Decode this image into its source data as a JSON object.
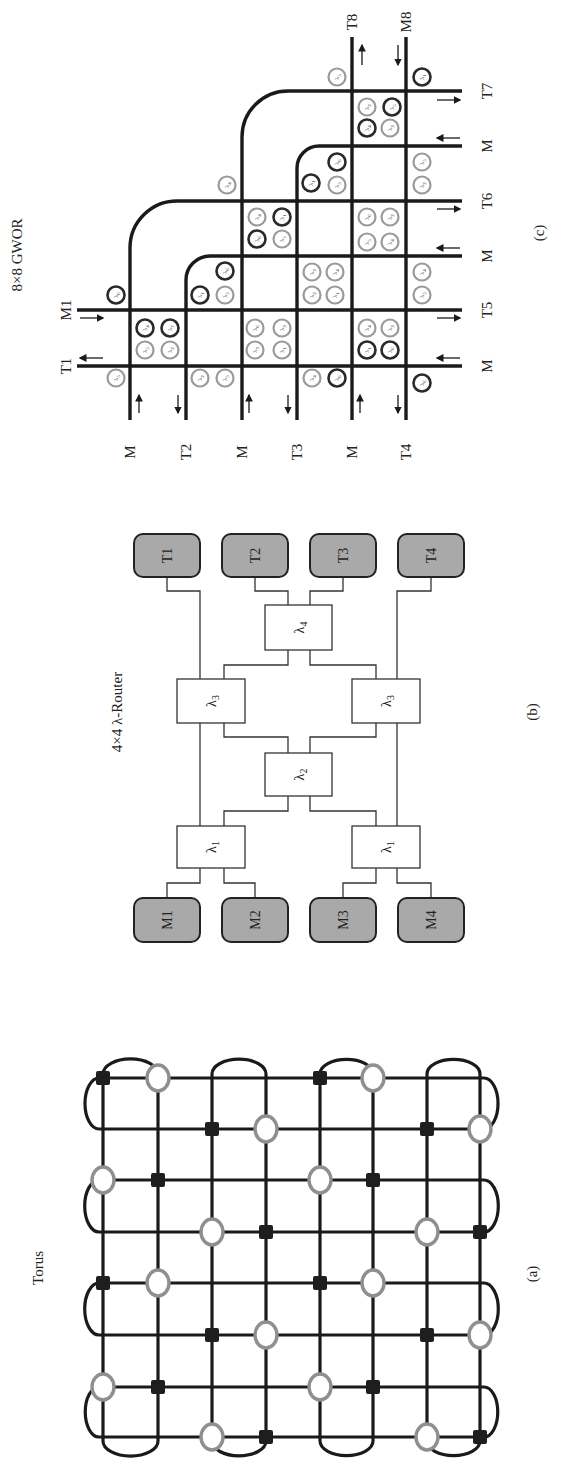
{
  "figure": {
    "panels": [
      {
        "id": "a",
        "title": "Torus",
        "caption": "(a)"
      },
      {
        "id": "b",
        "title": "4×4 λ-Router",
        "caption": "(b)"
      },
      {
        "id": "c",
        "title": "8×8 GWOR",
        "caption": "(c)"
      }
    ]
  },
  "colors": {
    "line": "#1a1a1a",
    "ring_dark": "#2a2a2a",
    "ring_gray": "#9a9a9a",
    "terminal_fill": "#a9a9a9",
    "oval_stroke": "#8f8f8f",
    "square_fill": "#1e1e1e"
  },
  "torus": {
    "title_pos": [
      38,
      1268
    ],
    "caption_pos": [
      532,
      1274
    ],
    "cols": [
      103,
      158,
      212,
      266,
      320,
      373,
      427,
      480
    ],
    "rows": [
      1078,
      1129,
      1180,
      1232,
      1283,
      1335,
      1387,
      1437
    ],
    "nodes": [
      {
        "row": 0,
        "col": 0,
        "type": "square"
      },
      {
        "row": 0,
        "col": 1,
        "type": "oval"
      },
      {
        "row": 0,
        "col": 4,
        "type": "square"
      },
      {
        "row": 0,
        "col": 5,
        "type": "oval"
      },
      {
        "row": 1,
        "col": 2,
        "type": "square"
      },
      {
        "row": 1,
        "col": 3,
        "type": "oval"
      },
      {
        "row": 1,
        "col": 6,
        "type": "square"
      },
      {
        "row": 1,
        "col": 7,
        "type": "oval"
      },
      {
        "row": 2,
        "col": 0,
        "type": "oval"
      },
      {
        "row": 2,
        "col": 1,
        "type": "square"
      },
      {
        "row": 2,
        "col": 4,
        "type": "oval"
      },
      {
        "row": 2,
        "col": 5,
        "type": "square"
      },
      {
        "row": 3,
        "col": 2,
        "type": "oval"
      },
      {
        "row": 3,
        "col": 3,
        "type": "square"
      },
      {
        "row": 3,
        "col": 6,
        "type": "oval"
      },
      {
        "row": 3,
        "col": 7,
        "type": "square"
      },
      {
        "row": 4,
        "col": 0,
        "type": "square"
      },
      {
        "row": 4,
        "col": 1,
        "type": "oval"
      },
      {
        "row": 4,
        "col": 4,
        "type": "square"
      },
      {
        "row": 4,
        "col": 5,
        "type": "oval"
      },
      {
        "row": 5,
        "col": 2,
        "type": "square"
      },
      {
        "row": 5,
        "col": 3,
        "type": "oval"
      },
      {
        "row": 5,
        "col": 6,
        "type": "square"
      },
      {
        "row": 5,
        "col": 7,
        "type": "oval"
      },
      {
        "row": 6,
        "col": 0,
        "type": "oval"
      },
      {
        "row": 6,
        "col": 1,
        "type": "square"
      },
      {
        "row": 6,
        "col": 4,
        "type": "oval"
      },
      {
        "row": 6,
        "col": 5,
        "type": "square"
      },
      {
        "row": 7,
        "col": 2,
        "type": "oval"
      },
      {
        "row": 7,
        "col": 3,
        "type": "square"
      },
      {
        "row": 7,
        "col": 6,
        "type": "oval"
      },
      {
        "row": 7,
        "col": 7,
        "type": "square"
      }
    ]
  },
  "router": {
    "title_pos": [
      117,
      712
    ],
    "caption_pos": [
      532,
      712
    ],
    "terminals": [
      {
        "label": "T1",
        "x": 134,
        "y": 534,
        "w": 66,
        "h": 43
      },
      {
        "label": "T2",
        "x": 222,
        "y": 534,
        "w": 66,
        "h": 43
      },
      {
        "label": "T3",
        "x": 310,
        "y": 534,
        "w": 66,
        "h": 43
      },
      {
        "label": "T4",
        "x": 398,
        "y": 534,
        "w": 66,
        "h": 43
      },
      {
        "label": "M1",
        "x": 134,
        "y": 898,
        "w": 66,
        "h": 44
      },
      {
        "label": "M2",
        "x": 222,
        "y": 898,
        "w": 66,
        "h": 44
      },
      {
        "label": "M3",
        "x": 310,
        "y": 898,
        "w": 66,
        "h": 44
      },
      {
        "label": "M4",
        "x": 398,
        "y": 898,
        "w": 66,
        "h": 44
      }
    ],
    "filters": [
      {
        "label": "λ",
        "sub": "4",
        "x": 265,
        "y": 605,
        "w": 67,
        "h": 45
      },
      {
        "label": "λ",
        "sub": "3",
        "x": 177,
        "y": 679,
        "w": 68,
        "h": 44
      },
      {
        "label": "λ",
        "sub": "3",
        "x": 352,
        "y": 679,
        "w": 68,
        "h": 44
      },
      {
        "label": "λ",
        "sub": "2",
        "x": 265,
        "y": 753,
        "w": 67,
        "h": 43
      },
      {
        "label": "λ",
        "sub": "1",
        "x": 177,
        "y": 826,
        "w": 68,
        "h": 42
      },
      {
        "label": "λ",
        "sub": "1",
        "x": 352,
        "y": 826,
        "w": 68,
        "h": 42
      }
    ],
    "wires": [
      [
        [
          167,
          577
        ],
        [
          167,
          591
        ],
        [
          200,
          591
        ],
        [
          200,
          679
        ]
      ],
      [
        [
          255,
          577
        ],
        [
          255,
          591
        ],
        [
          288,
          591
        ],
        [
          288,
          605
        ]
      ],
      [
        [
          343,
          577
        ],
        [
          343,
          591
        ],
        [
          310,
          591
        ],
        [
          310,
          605
        ]
      ],
      [
        [
          431,
          577
        ],
        [
          431,
          591
        ],
        [
          397,
          591
        ],
        [
          397,
          679
        ]
      ],
      [
        [
          288,
          650
        ],
        [
          288,
          665
        ],
        [
          224,
          665
        ],
        [
          224,
          679
        ]
      ],
      [
        [
          310,
          650
        ],
        [
          310,
          665
        ],
        [
          376,
          665
        ],
        [
          376,
          679
        ]
      ],
      [
        [
          200,
          723
        ],
        [
          200,
          826
        ]
      ],
      [
        [
          397,
          723
        ],
        [
          397,
          826
        ]
      ],
      [
        [
          224,
          723
        ],
        [
          224,
          737
        ],
        [
          288,
          737
        ],
        [
          288,
          753
        ]
      ],
      [
        [
          376,
          723
        ],
        [
          376,
          737
        ],
        [
          310,
          737
        ],
        [
          310,
          753
        ]
      ],
      [
        [
          288,
          796
        ],
        [
          288,
          811
        ],
        [
          224,
          811
        ],
        [
          224,
          826
        ]
      ],
      [
        [
          310,
          796
        ],
        [
          310,
          811
        ],
        [
          376,
          811
        ],
        [
          376,
          826
        ]
      ],
      [
        [
          200,
          868
        ],
        [
          200,
          883
        ],
        [
          167,
          883
        ],
        [
          167,
          898
        ]
      ],
      [
        [
          224,
          868
        ],
        [
          224,
          883
        ],
        [
          255,
          883
        ],
        [
          255,
          898
        ]
      ],
      [
        [
          376,
          868
        ],
        [
          376,
          883
        ],
        [
          343,
          883
        ],
        [
          343,
          898
        ]
      ],
      [
        [
          397,
          868
        ],
        [
          397,
          883
        ],
        [
          431,
          883
        ],
        [
          431,
          898
        ]
      ]
    ]
  },
  "gwor": {
    "title_pos": [
      17,
      255
    ],
    "caption_pos": [
      539,
      233
    ],
    "vlines": [
      {
        "x": 130,
        "y1": 247,
        "y2": 420,
        "label": "M",
        "curve_to_row": 201,
        "r": 47
      },
      {
        "x": 186,
        "y1": 280,
        "y2": 420,
        "label": "T2",
        "curve_to_row": 256,
        "r": 24
      },
      {
        "x": 242,
        "y1": 137,
        "y2": 420,
        "label": "M",
        "curve_to_row": 91,
        "r": 46
      },
      {
        "x": 297,
        "y1": 168,
        "y2": 420,
        "label": "T3",
        "curve_to_row": 146,
        "r": 22
      },
      {
        "x": 352,
        "y1": 37,
        "y2": 420,
        "label": "M",
        "top_label": "T8"
      },
      {
        "x": 406,
        "y1": 37,
        "y2": 420,
        "label": "T4",
        "top_label": "M8"
      }
    ],
    "hlines": [
      {
        "y": 91,
        "x1": 288,
        "x2": 462,
        "label": "T7"
      },
      {
        "y": 146,
        "x1": 319,
        "x2": 462,
        "label": "M"
      },
      {
        "y": 201,
        "x1": 177,
        "x2": 462,
        "label": "T6"
      },
      {
        "y": 256,
        "x1": 210,
        "x2": 462,
        "label": "M"
      },
      {
        "y": 310,
        "x1": 77,
        "x2": 462,
        "label": "T5",
        "left_label": "M1"
      },
      {
        "y": 366,
        "x1": 77,
        "x2": 462,
        "label": "M",
        "left_label": "T1"
      }
    ],
    "bottom_label_y": 452,
    "right_label_x": 487,
    "top_label_y": 22,
    "left_label_x": 66,
    "arrows": [
      {
        "x1": 80,
        "y1": 318,
        "x2": 103,
        "y2": 318
      },
      {
        "x1": 103,
        "y1": 358,
        "x2": 80,
        "y2": 358
      },
      {
        "x1": 139,
        "y1": 413,
        "x2": 139,
        "y2": 395
      },
      {
        "x1": 178,
        "y1": 395,
        "x2": 178,
        "y2": 413
      },
      {
        "x1": 249,
        "y1": 413,
        "x2": 249,
        "y2": 395
      },
      {
        "x1": 288,
        "y1": 395,
        "x2": 288,
        "y2": 413
      },
      {
        "x1": 360,
        "y1": 413,
        "x2": 360,
        "y2": 395
      },
      {
        "x1": 398,
        "y1": 395,
        "x2": 398,
        "y2": 413
      },
      {
        "x1": 437,
        "y1": 100,
        "x2": 460,
        "y2": 100
      },
      {
        "x1": 460,
        "y1": 138,
        "x2": 437,
        "y2": 138
      },
      {
        "x1": 437,
        "y1": 209,
        "x2": 460,
        "y2": 209
      },
      {
        "x1": 460,
        "y1": 248,
        "x2": 437,
        "y2": 248
      },
      {
        "x1": 437,
        "y1": 318,
        "x2": 460,
        "y2": 318
      },
      {
        "x1": 460,
        "y1": 358,
        "x2": 437,
        "y2": 358
      },
      {
        "x1": 362,
        "y1": 65,
        "x2": 362,
        "y2": 45
      },
      {
        "x1": 398,
        "y1": 45,
        "x2": 398,
        "y2": 65
      }
    ],
    "rings": [
      {
        "x": 116,
        "y": 295,
        "tone": "dark",
        "sub": "6"
      },
      {
        "x": 116,
        "y": 378,
        "tone": "gray",
        "sub": "5"
      },
      {
        "x": 145,
        "y": 328,
        "tone": "dark",
        "sub": "4"
      },
      {
        "x": 170,
        "y": 328,
        "tone": "dark",
        "sub": "7"
      },
      {
        "x": 145,
        "y": 350,
        "tone": "gray",
        "sub": "5"
      },
      {
        "x": 170,
        "y": 350,
        "tone": "gray",
        "sub": "2"
      },
      {
        "x": 200,
        "y": 295,
        "tone": "dark",
        "sub": "1"
      },
      {
        "x": 225,
        "y": 295,
        "tone": "gray",
        "sub": "5"
      },
      {
        "x": 225,
        "y": 271,
        "tone": "dark",
        "sub": "6"
      },
      {
        "x": 200,
        "y": 378,
        "tone": "gray",
        "sub": "2"
      },
      {
        "x": 225,
        "y": 378,
        "tone": "gray",
        "sub": "5"
      },
      {
        "x": 255,
        "y": 328,
        "tone": "gray",
        "sub": "6"
      },
      {
        "x": 282,
        "y": 328,
        "tone": "gray",
        "sub": "3"
      },
      {
        "x": 255,
        "y": 350,
        "tone": "gray",
        "sub": "3"
      },
      {
        "x": 282,
        "y": 350,
        "tone": "gray",
        "sub": "1"
      },
      {
        "x": 257,
        "y": 239,
        "tone": "dark",
        "sub": "6"
      },
      {
        "x": 282,
        "y": 239,
        "tone": "gray",
        "sub": "5"
      },
      {
        "x": 257,
        "y": 217,
        "tone": "gray",
        "sub": "4"
      },
      {
        "x": 282,
        "y": 217,
        "tone": "dark",
        "sub": "1"
      },
      {
        "x": 227,
        "y": 185,
        "tone": "gray",
        "sub": "4"
      },
      {
        "x": 312,
        "y": 295,
        "tone": "gray",
        "sub": "2"
      },
      {
        "x": 335,
        "y": 295,
        "tone": "gray",
        "sub": "1"
      },
      {
        "x": 312,
        "y": 272,
        "tone": "gray",
        "sub": "3"
      },
      {
        "x": 335,
        "y": 272,
        "tone": "gray",
        "sub": "4"
      },
      {
        "x": 312,
        "y": 378,
        "tone": "gray",
        "sub": "4"
      },
      {
        "x": 337,
        "y": 378,
        "tone": "dark",
        "sub": "6"
      },
      {
        "x": 311,
        "y": 183,
        "tone": "dark",
        "sub": "1"
      },
      {
        "x": 337,
        "y": 185,
        "tone": "gray",
        "sub": "5"
      },
      {
        "x": 337,
        "y": 162,
        "tone": "dark",
        "sub": "6"
      },
      {
        "x": 367,
        "y": 350,
        "tone": "dark",
        "sub": "1"
      },
      {
        "x": 390,
        "y": 350,
        "tone": "dark",
        "sub": "6"
      },
      {
        "x": 367,
        "y": 328,
        "tone": "gray",
        "sub": "4"
      },
      {
        "x": 390,
        "y": 328,
        "tone": "gray",
        "sub": "3"
      },
      {
        "x": 367,
        "y": 242,
        "tone": "gray",
        "sub": "5"
      },
      {
        "x": 390,
        "y": 242,
        "tone": "gray",
        "sub": "4"
      },
      {
        "x": 367,
        "y": 217,
        "tone": "gray",
        "sub": "6"
      },
      {
        "x": 390,
        "y": 217,
        "tone": "gray",
        "sub": "2"
      },
      {
        "x": 367,
        "y": 128,
        "tone": "dark",
        "sub": "4"
      },
      {
        "x": 390,
        "y": 128,
        "tone": "gray",
        "sub": "3"
      },
      {
        "x": 367,
        "y": 107,
        "tone": "gray",
        "sub": "2"
      },
      {
        "x": 392,
        "y": 107,
        "tone": "dark",
        "sub": "5"
      },
      {
        "x": 337,
        "y": 77,
        "tone": "gray",
        "sub": "5"
      },
      {
        "x": 422,
        "y": 77,
        "tone": "dark",
        "sub": "1"
      },
      {
        "x": 422,
        "y": 162,
        "tone": "gray",
        "sub": "5"
      },
      {
        "x": 422,
        "y": 185,
        "tone": "gray",
        "sub": "2"
      },
      {
        "x": 422,
        "y": 272,
        "tone": "gray",
        "sub": "4"
      },
      {
        "x": 422,
        "y": 295,
        "tone": "gray",
        "sub": "5"
      },
      {
        "x": 422,
        "y": 383,
        "tone": "dark",
        "sub": "6"
      }
    ]
  }
}
